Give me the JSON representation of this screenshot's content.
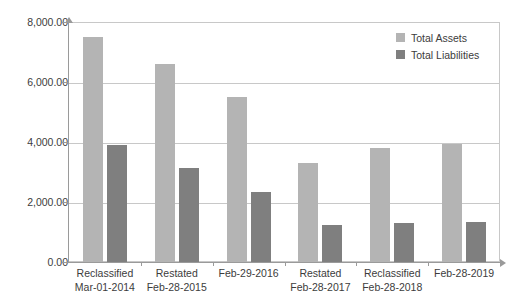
{
  "chart_data": {
    "type": "bar",
    "title": "",
    "subtitle": "",
    "xlabel": "",
    "ylabel": "",
    "ylim": [
      0,
      8000
    ],
    "ytick_values": [
      0,
      2000,
      4000,
      6000,
      8000
    ],
    "ytick_labels": [
      "0.00",
      "2,000.00",
      "4,000.00",
      "6,000.00",
      "8,000.00"
    ],
    "grid": true,
    "legend_position": "top-right",
    "categories": [
      "Reclassified\nMar-01-2014",
      "Restated\nFeb-28-2015",
      "Feb-29-2016",
      "Restated\nFeb-28-2017",
      "Reclassified\nFeb-28-2018",
      "Feb-28-2019"
    ],
    "category_lines": [
      [
        "Reclassified",
        "Mar-01-2014"
      ],
      [
        "Restated",
        "Feb-28-2015"
      ],
      [
        "Feb-29-2016",
        ""
      ],
      [
        "Restated",
        "Feb-28-2017"
      ],
      [
        "Reclassified",
        "Feb-28-2018"
      ],
      [
        "Feb-28-2019",
        ""
      ]
    ],
    "series": [
      {
        "name": "Total Assets",
        "color": "#b4b4b4",
        "values": [
          7500,
          6600,
          5500,
          3300,
          3800,
          3950
        ]
      },
      {
        "name": "Total Liabilities",
        "color": "#7f7f7f",
        "values": [
          3900,
          3120,
          2340,
          1250,
          1300,
          1350
        ]
      }
    ]
  },
  "legend": {
    "items": [
      {
        "label": "Total Assets",
        "color": "#b4b4b4"
      },
      {
        "label": "Total Liabilities",
        "color": "#7f7f7f"
      }
    ]
  }
}
